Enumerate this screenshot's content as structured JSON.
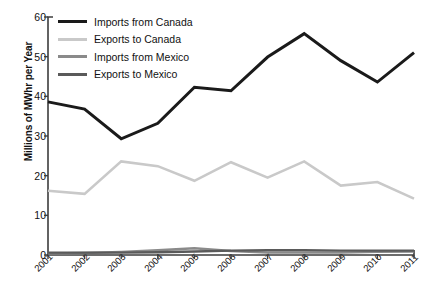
{
  "chart_data": {
    "type": "line",
    "title": "",
    "xlabel": "",
    "ylabel": "Millions of MWhr per Year",
    "categories": [
      "2001",
      "2002",
      "2003",
      "2004",
      "2005",
      "2006",
      "2007",
      "2008",
      "2009",
      "2010",
      "2011"
    ],
    "x": [
      2001,
      2002,
      2003,
      2004,
      2005,
      2006,
      2007,
      2008,
      2009,
      2010,
      2011
    ],
    "ylim": [
      0,
      60
    ],
    "yticks": [
      0,
      10,
      20,
      30,
      40,
      50,
      60
    ],
    "grid": false,
    "legend_position": "top-left",
    "series": [
      {
        "name": "Imports from Canada",
        "color": "#1a1a1a",
        "values": [
          38.6,
          36.8,
          29.3,
          33.2,
          42.3,
          41.4,
          49.9,
          55.8,
          49.0,
          43.6,
          51.0
        ]
      },
      {
        "name": "Exports to Canada",
        "color": "#c9c9c9",
        "values": [
          16.2,
          15.4,
          23.6,
          22.4,
          18.7,
          23.4,
          19.5,
          23.6,
          17.5,
          18.4,
          14.2
        ]
      },
      {
        "name": "Imports from Mexico",
        "color": "#8a8a8a",
        "values": [
          0.4,
          0.5,
          0.8,
          1.2,
          1.7,
          1.0,
          0.6,
          0.6,
          0.6,
          0.8,
          0.9
        ]
      },
      {
        "name": "Exports to Mexico",
        "color": "#5a5a5a",
        "values": [
          0.6,
          0.6,
          0.6,
          0.7,
          0.9,
          1.1,
          1.2,
          1.2,
          1.1,
          1.1,
          1.1
        ]
      }
    ]
  },
  "axis": {
    "ytick_labels": [
      "60",
      "50",
      "40",
      "30",
      "20",
      "10",
      "0"
    ],
    "xtick_labels": [
      "2001",
      "2002",
      "2003",
      "2004",
      "2005",
      "2006",
      "2007",
      "2008",
      "2009",
      "2010",
      "2011"
    ],
    "y_title": "Millions of MWhr per Year"
  },
  "legend": {
    "items": [
      {
        "label": "Imports from Canada",
        "color": "#1a1a1a"
      },
      {
        "label": "Exports to Canada",
        "color": "#c9c9c9"
      },
      {
        "label": "Imports from Mexico",
        "color": "#8a8a8a"
      },
      {
        "label": "Exports to Mexico",
        "color": "#5a5a5a"
      }
    ]
  },
  "colors": {
    "axis": "#3d3d3d",
    "text": "#111111",
    "background": "#ffffff"
  }
}
